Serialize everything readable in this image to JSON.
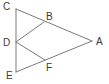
{
  "diagram": {
    "type": "geometry-figure",
    "points": {
      "A": {
        "label": "A",
        "x": 92,
        "y": 41,
        "lx": 96,
        "ly": 45
      },
      "B": {
        "label": "B",
        "x": 44,
        "y": 22,
        "lx": 46,
        "ly": 20
      },
      "C": {
        "label": "C",
        "x": 16,
        "y": 9,
        "lx": 3,
        "ly": 10
      },
      "D": {
        "label": "D",
        "x": 16,
        "y": 42,
        "lx": 3,
        "ly": 46
      },
      "E": {
        "label": "E",
        "x": 16,
        "y": 72,
        "lx": 6,
        "ly": 79
      },
      "F": {
        "label": "F",
        "x": 45,
        "y": 60,
        "lx": 46,
        "ly": 71
      }
    },
    "segments": [
      {
        "from": "C",
        "to": "A"
      },
      {
        "from": "E",
        "to": "A"
      },
      {
        "from": "C",
        "to": "E"
      },
      {
        "from": "D",
        "to": "B"
      },
      {
        "from": "D",
        "to": "F"
      }
    ],
    "colors": {
      "line": "#7a7a7a",
      "label": "#3a3a3a",
      "background": "#ffffff"
    }
  }
}
